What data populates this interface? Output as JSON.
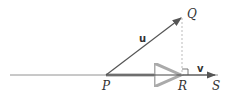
{
  "diagram": {
    "points": {
      "P": {
        "label": "P",
        "x": 106,
        "y": 75
      },
      "Q": {
        "label": "Q",
        "x": 182,
        "y": 17
      },
      "R": {
        "label": "R",
        "x": 182,
        "y": 75
      },
      "S": {
        "label": "S",
        "x": 215,
        "y": 75
      }
    },
    "vectors": {
      "u": {
        "label": "u",
        "from": "P",
        "to": "Q"
      },
      "v": {
        "label": "v",
        "from": "R",
        "to": "S"
      },
      "projection": {
        "label": "",
        "from": "P",
        "to": "R"
      }
    },
    "colors": {
      "line": "#555555",
      "text": "#333333",
      "projection": "#999999",
      "dashed": "#aaaaaa"
    }
  }
}
